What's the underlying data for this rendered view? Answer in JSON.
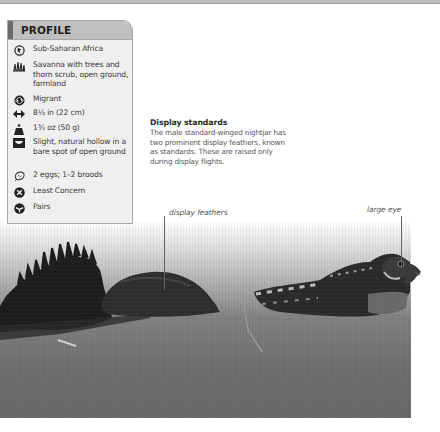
{
  "page": {
    "top_rule_color": "#bdbdbd"
  },
  "profile": {
    "title": "PROFILE",
    "rows": [
      {
        "icon": "range-map-icon",
        "text": "Sub-Saharan Africa"
      },
      {
        "icon": "habitat-grass-icon",
        "text": "Savanna with trees and thorn scrub, open ground, farmland"
      },
      {
        "icon": "migration-arrows-icon",
        "text": "Migrant"
      },
      {
        "icon": "length-arrows-icon",
        "text": "8½ in (22 cm)"
      },
      {
        "icon": "weight-icon",
        "text": "1¾ oz (50 g)"
      },
      {
        "icon": "nest-icon",
        "text": "Slight, natural hollow in a bare spot of open ground"
      },
      {
        "icon": "egg-icon",
        "text": "2 eggs; 1–2 broods"
      },
      {
        "icon": "conservation-status-icon",
        "text": "Least Concern"
      },
      {
        "icon": "social-pairs-icon",
        "text": "Pairs"
      }
    ]
  },
  "article": {
    "heading": "Display standards",
    "body": "The male standard-winged nightjar has two prominent display feathers, known as standards. These are raised only during display flights."
  },
  "photo": {
    "subject": "standard-winged nightjar",
    "callouts": [
      {
        "label": "display feathers"
      },
      {
        "label": "large eye"
      }
    ]
  }
}
